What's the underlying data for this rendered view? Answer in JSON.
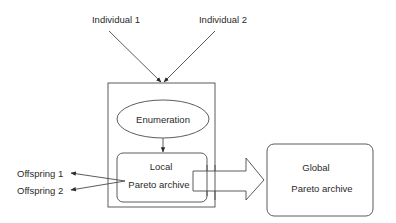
{
  "diagram": {
    "inputs": [
      {
        "label": "Individual 1"
      },
      {
        "label": "Individual 2"
      }
    ],
    "process": {
      "enumeration_label": "Enumeration",
      "local_archive": {
        "line1": "Local",
        "line2": "Pareto archive"
      }
    },
    "outputs": [
      {
        "label": "Offspring 1"
      },
      {
        "label": "Offspring 2"
      }
    ],
    "global_archive": {
      "line1": "Global",
      "line2": "Pareto archive"
    },
    "colors": {
      "line": "#4a4a4a",
      "text": "#2a2a2a",
      "background": "#ffffff"
    }
  }
}
